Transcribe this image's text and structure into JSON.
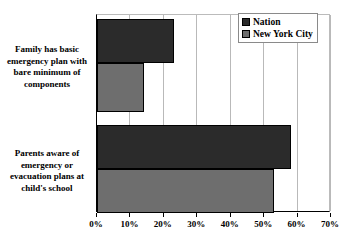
{
  "chart_data": {
    "type": "bar",
    "orientation": "horizontal",
    "title": "",
    "xlabel": "",
    "ylabel": "",
    "xlim": [
      0,
      70
    ],
    "xtick_labels": [
      "0%",
      "10%",
      "20%",
      "30%",
      "40%",
      "50%",
      "60%",
      "70%"
    ],
    "xtick_values": [
      0,
      10,
      20,
      30,
      40,
      50,
      60,
      70
    ],
    "grid": true,
    "legend_position": "top-right",
    "categories": [
      "Family has basic emergency plan with bare minimum of components",
      "Parents aware of emergency or evacuation plans at child's school"
    ],
    "series": [
      {
        "name": "Nation",
        "color": "#2b2b2b",
        "values": [
          23,
          58
        ]
      },
      {
        "name": "New York City",
        "color": "#6e6e6e",
        "values": [
          14,
          53
        ]
      }
    ]
  },
  "legend": {
    "items": [
      {
        "label": "Nation",
        "swatch": "nation"
      },
      {
        "label": "New York City",
        "swatch": "nyc"
      }
    ]
  },
  "axis": {
    "ticks": [
      {
        "label": "0%",
        "value": 0
      },
      {
        "label": "10%",
        "value": 10
      },
      {
        "label": "20%",
        "value": 20
      },
      {
        "label": "30%",
        "value": 30
      },
      {
        "label": "40%",
        "value": 40
      },
      {
        "label": "50%",
        "value": 50
      },
      {
        "label": "60%",
        "value": 60
      },
      {
        "label": "70%",
        "value": 70
      }
    ]
  },
  "categories": [
    {
      "label": "Family has basic emergency plan with bare minimum of components"
    },
    {
      "label": "Parents aware of emergency or evacuation plans at child's school"
    }
  ]
}
